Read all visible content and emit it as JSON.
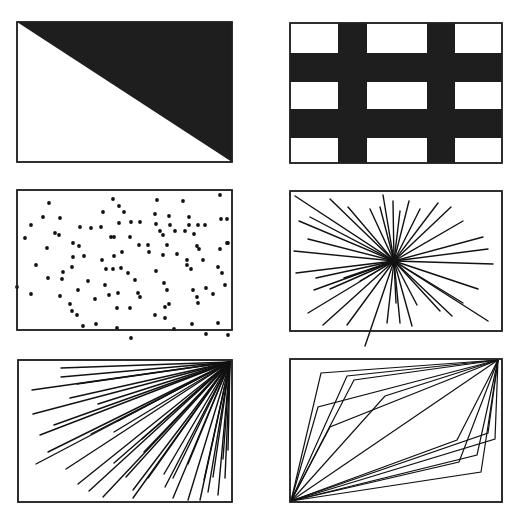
{
  "figure": {
    "colors": {
      "ink": "#111111",
      "fill": "#1e1e1e",
      "background": "#ffffff",
      "frame": "#222222"
    }
  },
  "panels": [
    {
      "id": "diagonal-split",
      "box": {
        "x": 17,
        "y": 22,
        "w": 215,
        "h": 140
      },
      "shape": "triangle-top-right-filled"
    },
    {
      "id": "grid-bars",
      "box": {
        "x": 290,
        "y": 23,
        "w": 212,
        "h": 140
      },
      "vertical_bars": [
        {
          "x": 48,
          "w": 29
        },
        {
          "x": 137,
          "w": 28
        }
      ],
      "horizontal_bars": [
        {
          "y": 30,
          "w_h": 29
        },
        {
          "y": 86,
          "w_h": 29
        }
      ]
    },
    {
      "id": "random-dots",
      "box": {
        "x": 17,
        "y": 190,
        "w": 215,
        "h": 140
      },
      "dots": [
        [
          32,
          13
        ],
        [
          96,
          9
        ],
        [
          102,
          16
        ],
        [
          140,
          10
        ],
        [
          166,
          11
        ],
        [
          203,
          5
        ],
        [
          26,
          27
        ],
        [
          43,
          28
        ],
        [
          86,
          22
        ],
        [
          107,
          22
        ],
        [
          138,
          24
        ],
        [
          152,
          26
        ],
        [
          172,
          27
        ],
        [
          204,
          29
        ],
        [
          210,
          29
        ],
        [
          14,
          35
        ],
        [
          63,
          37
        ],
        [
          74,
          38
        ],
        [
          84,
          37
        ],
        [
          102,
          33
        ],
        [
          114,
          32
        ],
        [
          123,
          32
        ],
        [
          139,
          34
        ],
        [
          153,
          35
        ],
        [
          172,
          35
        ],
        [
          181,
          35
        ],
        [
          8,
          48
        ],
        [
          38,
          43
        ],
        [
          42,
          45
        ],
        [
          94,
          47
        ],
        [
          97,
          47
        ],
        [
          113,
          47
        ],
        [
          143,
          41
        ],
        [
          146,
          45
        ],
        [
          158,
          41
        ],
        [
          168,
          41
        ],
        [
          177,
          44
        ],
        [
          188,
          35
        ],
        [
          210,
          53
        ],
        [
          30,
          58
        ],
        [
          56,
          53
        ],
        [
          62,
          56
        ],
        [
          122,
          55
        ],
        [
          131,
          55
        ],
        [
          150,
          55
        ],
        [
          180,
          56
        ],
        [
          182,
          59
        ],
        [
          203,
          59
        ],
        [
          211,
          53
        ],
        [
          56,
          67
        ],
        [
          67,
          66
        ],
        [
          85,
          70
        ],
        [
          97,
          66
        ],
        [
          105,
          62
        ],
        [
          132,
          62
        ],
        [
          146,
          65
        ],
        [
          160,
          64
        ],
        [
          170,
          70
        ],
        [
          186,
          70
        ],
        [
          19,
          75
        ],
        [
          55,
          77
        ],
        [
          46,
          82
        ],
        [
          89,
          79
        ],
        [
          96,
          79
        ],
        [
          104,
          78
        ],
        [
          111,
          83
        ],
        [
          139,
          81
        ],
        [
          170,
          75
        ],
        [
          174,
          79
        ],
        [
          201,
          77
        ],
        [
          205,
          83
        ],
        [
          31,
          88
        ],
        [
          45,
          89
        ],
        [
          71,
          91
        ],
        [
          88,
          95
        ],
        [
          118,
          90
        ],
        [
          147,
          93
        ],
        [
          150,
          100
        ],
        [
          176,
          100
        ],
        [
          189,
          98
        ],
        [
          208,
          95
        ],
        [
          0,
          97
        ],
        [
          14,
          104
        ],
        [
          43,
          106
        ],
        [
          61,
          100
        ],
        [
          78,
          109
        ],
        [
          92,
          105
        ],
        [
          101,
          103
        ],
        [
          121,
          103
        ],
        [
          123,
          107
        ],
        [
          180,
          107
        ],
        [
          196,
          104
        ],
        [
          181,
          113
        ],
        [
          53,
          114
        ],
        [
          55,
          121
        ],
        [
          100,
          118
        ],
        [
          113,
          118
        ],
        [
          148,
          117
        ],
        [
          152,
          114
        ],
        [
          60,
          125
        ],
        [
          138,
          125
        ],
        [
          79,
          134
        ],
        [
          100,
          138
        ],
        [
          148,
          128
        ],
        [
          175,
          134
        ],
        [
          201,
          133
        ],
        [
          114,
          148
        ],
        [
          157,
          139
        ],
        [
          189,
          144
        ],
        [
          211,
          145
        ],
        [
          66,
          136
        ]
      ]
    },
    {
      "id": "radial-burst",
      "box": {
        "x": 290,
        "y": 191,
        "w": 212,
        "h": 140
      },
      "center": [
        104,
        70
      ],
      "endpoints": [
        [
          5,
          5
        ],
        [
          40,
          8
        ],
        [
          58,
          16
        ],
        [
          93,
          4
        ],
        [
          90,
          16
        ],
        [
          80,
          18
        ],
        [
          103,
          10
        ],
        [
          119,
          10
        ],
        [
          110,
          20
        ],
        [
          130,
          18
        ],
        [
          148,
          12
        ],
        [
          161,
          16
        ],
        [
          173,
          30
        ],
        [
          193,
          46
        ],
        [
          9,
          30
        ],
        [
          20,
          26
        ],
        [
          18,
          48
        ],
        [
          4,
          60
        ],
        [
          6,
          82
        ],
        [
          26,
          87
        ],
        [
          24,
          99
        ],
        [
          40,
          98
        ],
        [
          54,
          87
        ],
        [
          70,
          90
        ],
        [
          18,
          122
        ],
        [
          33,
          134
        ],
        [
          57,
          134
        ],
        [
          75,
          155
        ],
        [
          97,
          132
        ],
        [
          106,
          112
        ],
        [
          110,
          132
        ],
        [
          122,
          135
        ],
        [
          127,
          114
        ],
        [
          150,
          120
        ],
        [
          162,
          125
        ],
        [
          173,
          112
        ],
        [
          198,
          130
        ],
        [
          188,
          98
        ],
        [
          203,
          73
        ],
        [
          198,
          58
        ]
      ]
    },
    {
      "id": "corner-fan",
      "box": {
        "x": 18,
        "y": 360,
        "w": 214,
        "h": 142
      },
      "origin": [
        212,
        2
      ],
      "endpoints": [
        [
          43,
          8
        ],
        [
          43,
          17
        ],
        [
          14,
          30
        ],
        [
          59,
          24
        ],
        [
          52,
          38
        ],
        [
          80,
          44
        ],
        [
          15,
          54
        ],
        [
          36,
          65
        ],
        [
          100,
          61
        ],
        [
          22,
          75
        ],
        [
          30,
          92
        ],
        [
          73,
          74
        ],
        [
          96,
          72
        ],
        [
          18,
          104
        ],
        [
          124,
          79
        ],
        [
          48,
          109
        ],
        [
          96,
          103
        ],
        [
          126,
          92
        ],
        [
          60,
          124
        ],
        [
          71,
          131
        ],
        [
          108,
          117
        ],
        [
          130,
          118
        ],
        [
          85,
          137
        ],
        [
          115,
          130
        ],
        [
          146,
          114
        ],
        [
          115,
          138
        ],
        [
          147,
          127
        ],
        [
          155,
          118
        ],
        [
          170,
          104
        ],
        [
          155,
          138
        ],
        [
          170,
          140
        ],
        [
          182,
          140
        ],
        [
          186,
          120
        ],
        [
          190,
          132
        ],
        [
          200,
          135
        ],
        [
          195,
          117
        ],
        [
          205,
          99
        ],
        [
          207,
          118
        ],
        [
          210,
          90
        ]
      ]
    },
    {
      "id": "parallelogram-fan",
      "box": {
        "x": 290,
        "y": 359,
        "w": 212,
        "h": 143
      },
      "from": [
        1,
        142
      ],
      "to": [
        208,
        1
      ],
      "bends": [
        [
          31,
          14
        ],
        [
          28,
          48
        ],
        [
          57,
          17
        ],
        [
          64,
          21
        ],
        [
          40,
          68
        ],
        [
          95,
          37
        ],
        [
          167,
          81
        ],
        [
          169,
          103
        ],
        [
          191,
          113
        ],
        [
          205,
          80
        ],
        [
          187,
          96
        ],
        [
          198,
          74
        ]
      ]
    }
  ]
}
